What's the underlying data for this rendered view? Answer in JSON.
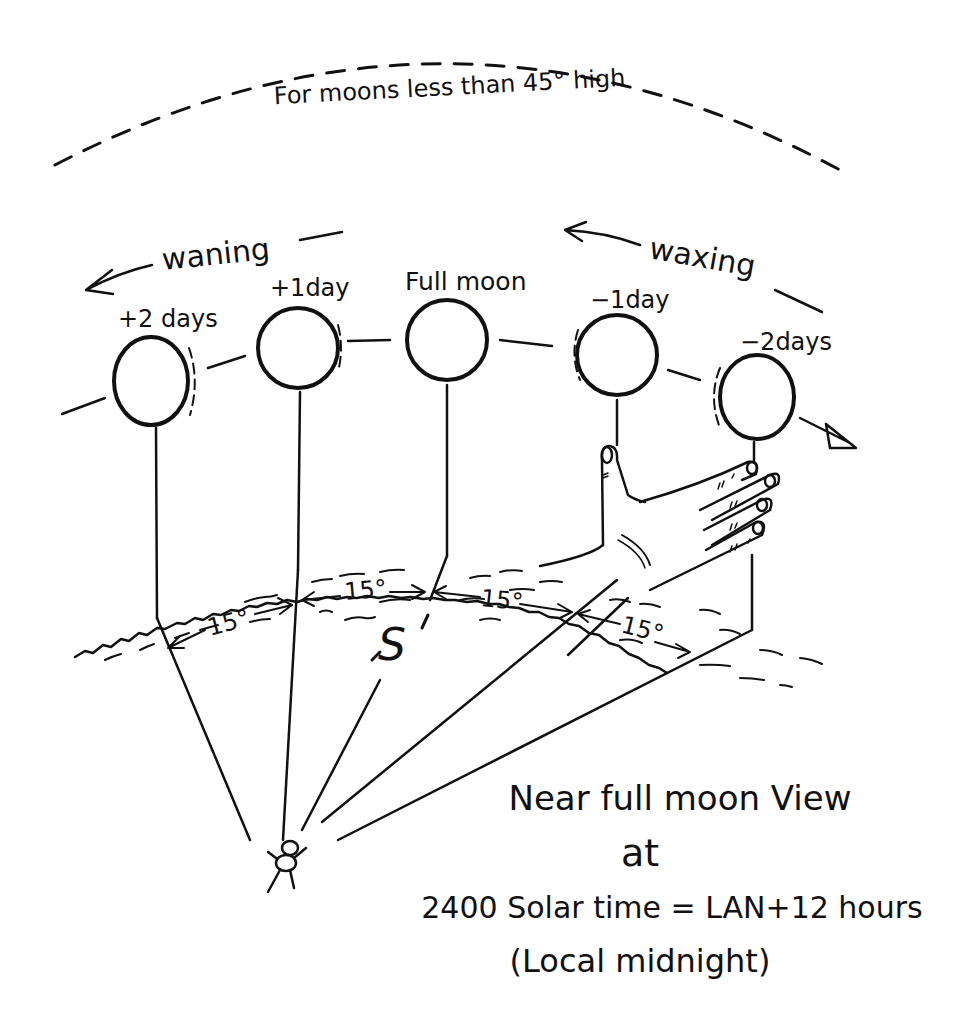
{
  "diagram": {
    "top_caption": "For moons less than 45° high",
    "waning_label": "waning",
    "waxing_label": "waxing",
    "moons": [
      {
        "label": "+2 days",
        "cx": 151,
        "cy": 381
      },
      {
        "label": "+1day",
        "cx": 298,
        "cy": 348
      },
      {
        "label": "Full moon",
        "cx": 447,
        "cy": 340
      },
      {
        "label": "−1day",
        "cx": 617,
        "cy": 355
      },
      {
        "label": "−2days",
        "cx": 757,
        "cy": 397
      }
    ],
    "angle_labels": [
      "15°",
      "15°",
      "15°",
      "15°"
    ],
    "direction_mark": "S",
    "title_lines": [
      "Near full moon View",
      "at",
      "2400 Solar time = LAN+12 hours",
      "(Local midnight)"
    ],
    "ink_color": "#111111",
    "background_color": "#ffffff"
  }
}
